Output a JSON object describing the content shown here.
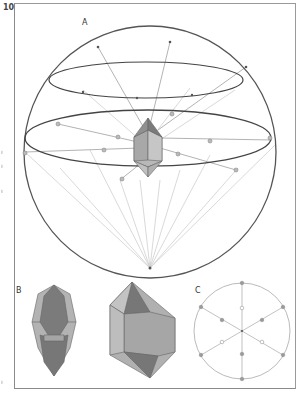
{
  "page": {
    "number": "10"
  },
  "figure": {
    "panels": [
      {
        "id": "A",
        "label": "A",
        "description": "Sphere projection of crystal faces"
      },
      {
        "id": "B",
        "label": "B",
        "description": "Two crystal habits"
      },
      {
        "id": "C",
        "label": "C",
        "description": "Stereographic projection"
      }
    ]
  },
  "margin_marks": [
    "ı",
    "ı",
    "ı",
    "ı"
  ],
  "colors": {
    "outline": "#555555",
    "ray": "#bdbdbd",
    "crystal_dark": "#7a7a7a",
    "crystal_light": "#b5b5b5",
    "crystal_mid": "#9c9c9c",
    "pole": "#a0a0a0"
  }
}
